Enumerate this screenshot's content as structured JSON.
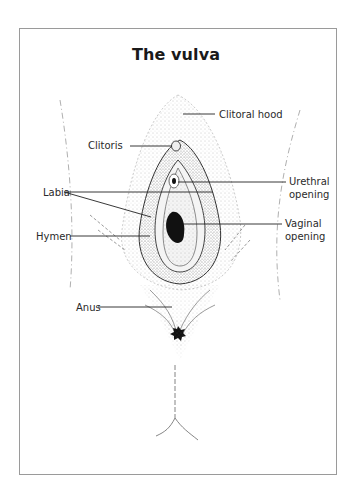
{
  "diagram": {
    "title": "The vulva",
    "labels": {
      "clitoral_hood": "Clitoral hood",
      "clitoris": "Clitoris",
      "labia": "Labia",
      "hymen": "Hymen",
      "urethral_opening_line1": "Urethral",
      "urethral_opening_line2": "opening",
      "vaginal_opening_line1": "Vaginal",
      "vaginal_opening_line2": "opening",
      "anus": "Anus"
    },
    "colors": {
      "line": "#333333",
      "stipple": "#8a8a8a",
      "frame": "#9a9a9a",
      "fill_dark": "#111111"
    }
  }
}
